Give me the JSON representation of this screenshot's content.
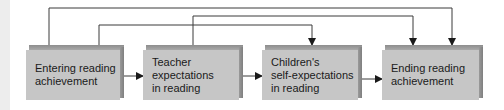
{
  "diagram": {
    "type": "flow",
    "colors": {
      "box_face": "#c6c6c6",
      "box_bevel": "#8d8d8d",
      "line": "#3a3a3a",
      "text": "#1a1a1a"
    },
    "nodes": [
      {
        "id": "entering",
        "label": "Entering reading\nachievement"
      },
      {
        "id": "teacher",
        "label": "Teacher\nexpectations\nin reading"
      },
      {
        "id": "children",
        "label": "Children's\nself-expectations\nin reading"
      },
      {
        "id": "ending",
        "label": "Ending reading\nachievement"
      }
    ],
    "edges": [
      {
        "from": "entering",
        "to": "teacher",
        "route": "direct"
      },
      {
        "from": "teacher",
        "to": "children",
        "route": "direct"
      },
      {
        "from": "children",
        "to": "ending",
        "route": "direct"
      },
      {
        "from": "entering",
        "to": "ending",
        "route": "over-top"
      },
      {
        "from": "teacher",
        "to": "ending",
        "route": "over-top"
      },
      {
        "from": "entering",
        "to": "children",
        "route": "over-top"
      }
    ]
  }
}
